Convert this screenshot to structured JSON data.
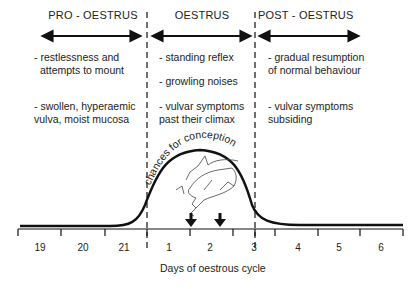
{
  "phases": [
    {
      "title": "PRO - OESTRUS",
      "signs": [
        "- restlessness and",
        "attempts to mount",
        "- swollen, hyperaemic",
        "vulva, moist mucosa"
      ]
    },
    {
      "title": "OESTRUS",
      "signs": [
        "- standing reflex",
        "- growling noises",
        "- vulvar symptoms",
        "past their climax"
      ]
    },
    {
      "title": "POST - OESTRUS",
      "signs": [
        "- gradual resumption",
        "of normal behaviour",
        "- vulvar symptoms",
        "subsiding"
      ]
    }
  ],
  "curve_label": "chances for conception",
  "axis": {
    "xlabel": "Days of oestrous cycle",
    "ticks": [
      "19",
      "20",
      "21",
      "1",
      "2",
      "3",
      "4",
      "5",
      "6"
    ]
  },
  "markers": {
    "arrows": 2,
    "illustration": "mating-pigs"
  },
  "colors": {
    "line": "#111111",
    "text": "#222222",
    "background": "#ffffff"
  }
}
